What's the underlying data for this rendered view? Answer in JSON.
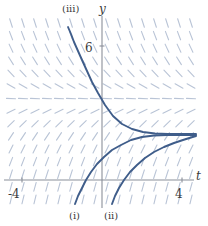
{
  "figure": {
    "type": "slope-field-diagram",
    "width": 208,
    "height": 226,
    "background": "#ffffff"
  },
  "axes": {
    "x_axis_label": "t",
    "y_axis_label": "y",
    "x_ticks": [
      {
        "label": "-4",
        "value": -4
      },
      {
        "label": "4",
        "value": 4
      }
    ],
    "y_ticks": [
      {
        "label": "6",
        "value": 6
      }
    ],
    "axis_color": "#8a8f99",
    "origin_px": {
      "x": 102,
      "y": 180
    },
    "xlim": [
      -5.2,
      5.2
    ],
    "ylim": [
      -2.4,
      10.6
    ]
  },
  "slope_field": {
    "color": "#b9c4d6",
    "equilibrium_y": 3.6,
    "grid_cols": 16,
    "grid_rows": 15,
    "x_start_px": 11,
    "y_start_px": 23,
    "dx_px": 12,
    "dy_px": 12.6,
    "segment_len_px": 9
  },
  "curves": [
    {
      "id": "curve-iii",
      "label": "(iii)",
      "label_px": {
        "x": 62,
        "y": 4
      },
      "color": "#3f5d8a",
      "description": "decreasing solution approaching equilibrium from above",
      "points_px": [
        [
          68,
          27
        ],
        [
          71,
          34
        ],
        [
          74,
          42
        ],
        [
          78,
          51
        ],
        [
          82,
          60
        ],
        [
          87,
          71
        ],
        [
          92,
          82
        ],
        [
          98,
          93
        ],
        [
          105,
          105
        ],
        [
          113,
          116
        ],
        [
          122,
          124
        ],
        [
          132,
          129
        ],
        [
          143,
          132
        ],
        [
          155,
          133.5
        ],
        [
          168,
          134
        ],
        [
          182,
          134
        ],
        [
          196,
          134
        ]
      ]
    },
    {
      "id": "curve-i",
      "label": "(i)",
      "label_px": {
        "x": 69,
        "y": 213
      },
      "color": "#3f5d8a",
      "description": "increasing solution approaching equilibrium from below, leftmost",
      "points_px": [
        [
          75,
          204
        ],
        [
          78,
          196
        ],
        [
          82,
          188
        ],
        [
          86,
          180
        ],
        [
          91,
          172
        ],
        [
          97,
          164
        ],
        [
          104,
          157
        ],
        [
          112,
          150
        ],
        [
          121,
          145
        ],
        [
          131,
          140
        ],
        [
          142,
          137
        ],
        [
          154,
          135.5
        ],
        [
          167,
          135
        ],
        [
          181,
          135
        ],
        [
          196,
          135
        ]
      ]
    },
    {
      "id": "curve-ii",
      "label": "(ii)",
      "label_px": {
        "x": 104,
        "y": 213
      },
      "color": "#3f5d8a",
      "description": "increasing solution approaching equilibrium from below, rightmost",
      "points_px": [
        [
          112,
          204
        ],
        [
          115,
          196
        ],
        [
          119,
          188
        ],
        [
          124,
          180
        ],
        [
          130,
          172
        ],
        [
          137,
          165
        ],
        [
          145,
          158
        ],
        [
          154,
          152
        ],
        [
          164,
          147
        ],
        [
          174,
          143
        ],
        [
          183,
          140
        ],
        [
          191,
          137.5
        ],
        [
          196,
          136
        ]
      ]
    }
  ]
}
